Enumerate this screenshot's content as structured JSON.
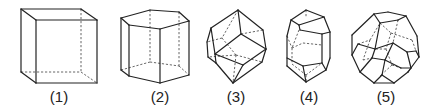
{
  "figure": {
    "colors": {
      "stroke": "#222222",
      "hidden": "#555555",
      "background": "#ffffff"
    },
    "shapes": [
      {
        "label": "(1)",
        "name": "cube",
        "label_x": 59,
        "solid": [
          [
            36,
            20,
            97,
            20
          ],
          [
            97,
            20,
            97,
            83
          ],
          [
            97,
            83,
            36,
            83
          ],
          [
            36,
            83,
            36,
            20
          ],
          [
            21,
            9,
            81,
            9
          ],
          [
            21,
            9,
            36,
            20
          ],
          [
            81,
            9,
            97,
            20
          ],
          [
            21,
            9,
            21,
            72
          ],
          [
            21,
            72,
            36,
            83
          ]
        ],
        "hidden": [
          [
            81,
            9,
            81,
            72
          ],
          [
            21,
            72,
            81,
            72
          ],
          [
            81,
            72,
            97,
            83
          ]
        ]
      },
      {
        "label": "(2)",
        "name": "hexagonal-prism",
        "label_x": 160,
        "solid": [
          [
            121,
            18,
            129,
            25
          ],
          [
            129,
            25,
            160,
            29
          ],
          [
            160,
            29,
            189,
            21
          ],
          [
            189,
            21,
            179,
            12
          ],
          [
            179,
            12,
            150,
            10
          ],
          [
            150,
            10,
            121,
            18
          ],
          [
            121,
            18,
            121,
            70
          ],
          [
            129,
            25,
            129,
            76
          ],
          [
            160,
            29,
            160,
            83
          ],
          [
            189,
            21,
            189,
            75
          ],
          [
            121,
            70,
            129,
            76
          ],
          [
            129,
            76,
            160,
            83
          ],
          [
            160,
            83,
            189,
            75
          ]
        ],
        "hidden": [
          [
            150,
            10,
            150,
            62
          ],
          [
            179,
            12,
            179,
            66
          ],
          [
            121,
            70,
            150,
            62
          ],
          [
            150,
            62,
            179,
            66
          ],
          [
            179,
            66,
            189,
            75
          ]
        ]
      },
      {
        "label": "(3)",
        "name": "rhombic-dodecahedron",
        "label_x": 236,
        "solid": [
          [
            238,
            10,
            211,
            28
          ],
          [
            211,
            28,
            207,
            42
          ],
          [
            207,
            42,
            208,
            57
          ],
          [
            208,
            57,
            216,
            63
          ],
          [
            216,
            63,
            233,
            83
          ],
          [
            233,
            83,
            262,
            62
          ],
          [
            262,
            62,
            266,
            49
          ],
          [
            266,
            49,
            263,
            30
          ],
          [
            263,
            30,
            238,
            10
          ],
          [
            238,
            10,
            241,
            34
          ],
          [
            241,
            34,
            215,
            54
          ],
          [
            215,
            54,
            216,
            63
          ],
          [
            241,
            34,
            266,
            49
          ],
          [
            215,
            54,
            243,
            65
          ],
          [
            243,
            65,
            266,
            49
          ],
          [
            243,
            65,
            233,
            83
          ],
          [
            211,
            28,
            215,
            54
          ]
        ],
        "hidden": [
          [
            238,
            10,
            222,
            38
          ],
          [
            222,
            38,
            207,
            42
          ],
          [
            222,
            38,
            236,
            55
          ],
          [
            236,
            55,
            262,
            62
          ],
          [
            236,
            55,
            208,
            57
          ],
          [
            236,
            55,
            233,
            83
          ],
          [
            241,
            34,
            263,
            30
          ]
        ]
      },
      {
        "label": "(4)",
        "name": "elongated-dodecahedron",
        "label_x": 309,
        "solid": [
          [
            306,
            10,
            291,
            20
          ],
          [
            291,
            20,
            287,
            36
          ],
          [
            287,
            36,
            287,
            66
          ],
          [
            287,
            66,
            306,
            82
          ],
          [
            306,
            82,
            326,
            70
          ],
          [
            326,
            70,
            330,
            58
          ],
          [
            330,
            58,
            330,
            32
          ],
          [
            330,
            32,
            324,
            17
          ],
          [
            324,
            17,
            306,
            10
          ],
          [
            291,
            20,
            299,
            25
          ],
          [
            299,
            25,
            324,
            17
          ],
          [
            299,
            25,
            300,
            30
          ],
          [
            300,
            30,
            322,
            34
          ],
          [
            322,
            34,
            330,
            32
          ],
          [
            322,
            34,
            322,
            63
          ],
          [
            322,
            63,
            326,
            70
          ],
          [
            287,
            58,
            303,
            66
          ],
          [
            303,
            66,
            322,
            63
          ],
          [
            303,
            66,
            306,
            82
          ]
        ],
        "hidden": [
          [
            306,
            10,
            306,
            18
          ],
          [
            299,
            30,
            292,
            48
          ],
          [
            292,
            48,
            303,
            43
          ],
          [
            303,
            43,
            322,
            45
          ],
          [
            292,
            48,
            292,
            64
          ],
          [
            292,
            64,
            306,
            75
          ],
          [
            306,
            75,
            322,
            63
          ],
          [
            306,
            75,
            306,
            82
          ],
          [
            287,
            36,
            292,
            48
          ]
        ]
      },
      {
        "label": "(5)",
        "name": "truncated-octahedron",
        "label_x": 386,
        "solid": [
          [
            374,
            14,
            388,
            12
          ],
          [
            388,
            12,
            406,
            16
          ],
          [
            406,
            16,
            417,
            36
          ],
          [
            417,
            36,
            419,
            57
          ],
          [
            419,
            57,
            408,
            72
          ],
          [
            408,
            72,
            394,
            83
          ],
          [
            394,
            83,
            374,
            83
          ],
          [
            374,
            83,
            360,
            72
          ],
          [
            360,
            72,
            352,
            55
          ],
          [
            352,
            55,
            352,
            35
          ],
          [
            352,
            35,
            374,
            14
          ],
          [
            374,
            14,
            380,
            23
          ],
          [
            380,
            23,
            398,
            20
          ],
          [
            398,
            20,
            406,
            16
          ],
          [
            380,
            23,
            375,
            49
          ],
          [
            375,
            49,
            358,
            44
          ],
          [
            358,
            44,
            352,
            55
          ],
          [
            375,
            49,
            393,
            43
          ],
          [
            393,
            43,
            407,
            52
          ],
          [
            407,
            52,
            416,
            51
          ],
          [
            416,
            51,
            419,
            57
          ],
          [
            407,
            52,
            411,
            68
          ],
          [
            393,
            43,
            385,
            60
          ],
          [
            375,
            49,
            372,
            58
          ],
          [
            372,
            58,
            385,
            60
          ],
          [
            372,
            58,
            360,
            72
          ],
          [
            385,
            60,
            382,
            75
          ],
          [
            382,
            75,
            374,
            83
          ],
          [
            382,
            75,
            394,
            83
          ],
          [
            385,
            60,
            401,
            68
          ],
          [
            401,
            68,
            411,
            68
          ],
          [
            411,
            68,
            408,
            72
          ]
        ],
        "hidden": [
          [
            398,
            20,
            393,
            43
          ],
          [
            380,
            23,
            391,
            33
          ],
          [
            391,
            33,
            412,
            40
          ],
          [
            412,
            40,
            416,
            51
          ],
          [
            391,
            33,
            386,
            49
          ],
          [
            386,
            49,
            375,
            49
          ],
          [
            358,
            44,
            370,
            40
          ],
          [
            370,
            40,
            380,
            23
          ],
          [
            386,
            49,
            392,
            65
          ],
          [
            392,
            65,
            401,
            68
          ],
          [
            370,
            40,
            363,
            60
          ],
          [
            363,
            60,
            372,
            58
          ],
          [
            392,
            65,
            380,
            76
          ],
          [
            380,
            76,
            382,
            75
          ]
        ]
      }
    ]
  }
}
